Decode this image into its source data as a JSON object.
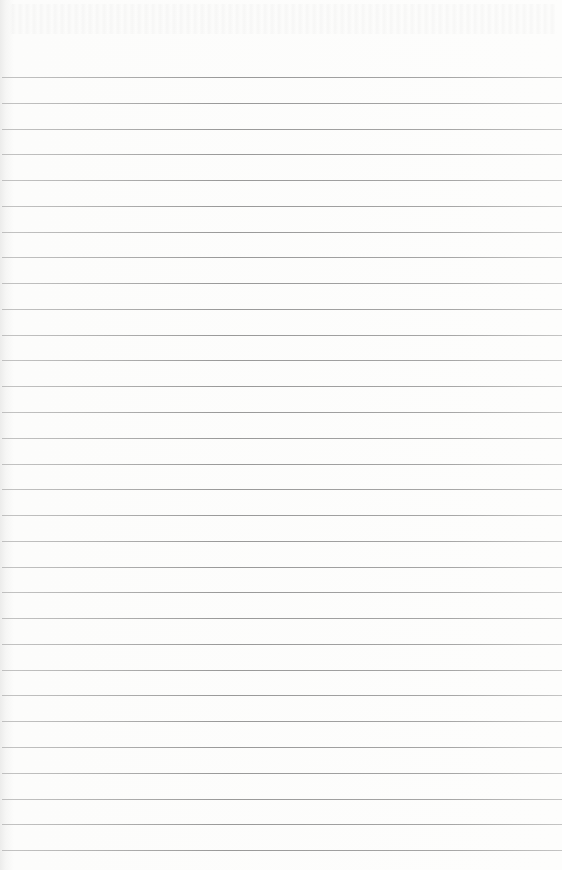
{
  "page": {
    "type": "lined-paper",
    "background_color": "#fbfbfa",
    "rule_color": "#8c8c8c",
    "rule_count": 31,
    "first_rule_y": 77,
    "rule_spacing": 25.77
  }
}
